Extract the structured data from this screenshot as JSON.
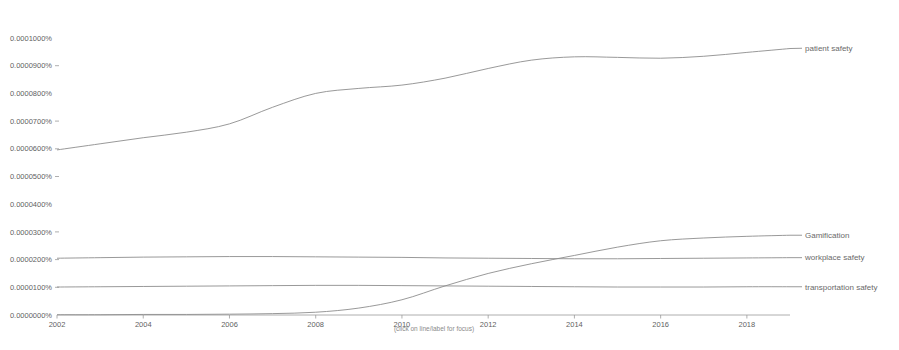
{
  "chart_data": {
    "type": "line",
    "title": "",
    "subtitle": "",
    "xlabel": "",
    "ylabel": "",
    "grid": false,
    "legend_position": "right-inline",
    "hint": "(click on line/label for focus)",
    "xlim": [
      2002,
      2019
    ],
    "ylim": [
      0.0,
      0.0001
    ],
    "y_tick_labels": [
      "0.0001000%",
      "0.0000900%",
      "0.0000800%",
      "0.0000700%",
      "0.0000600%",
      "0.0000500%",
      "0.0000400%",
      "0.0000300%",
      "0.0000200%",
      "0.0000100%",
      "0.0000000%"
    ],
    "y_tick_values": [
      0.0001,
      9e-05,
      8e-05,
      7e-05,
      6e-05,
      5e-05,
      4e-05,
      3e-05,
      2e-05,
      1e-05,
      0.0
    ],
    "x_tick_labels": [
      "2002",
      "2004",
      "2006",
      "2008",
      "2010",
      "2012",
      "2014",
      "2016",
      "2018"
    ],
    "x_tick_values": [
      2002,
      2004,
      2006,
      2008,
      2010,
      2012,
      2014,
      2016,
      2018
    ],
    "x": [
      2002,
      2003,
      2004,
      2005,
      2006,
      2007,
      2008,
      2009,
      2010,
      2011,
      2012,
      2013,
      2014,
      2015,
      2016,
      2017,
      2018,
      2019
    ],
    "series": [
      {
        "name": "patient safety",
        "color": "#8d8d8d",
        "label_y_value": 9.63e-05,
        "values": [
          5.96e-05,
          6.18e-05,
          6.4e-05,
          6.6e-05,
          6.9e-05,
          7.5e-05,
          8e-05,
          8.18e-05,
          8.3e-05,
          8.55e-05,
          8.9e-05,
          9.2e-05,
          9.32e-05,
          9.3e-05,
          9.27e-05,
          9.34e-05,
          9.48e-05,
          9.62e-05
        ]
      },
      {
        "name": "Gamification",
        "color": "#8d8d8d",
        "label_y_value": 2.88e-05,
        "values": [
          1e-07,
          1e-07,
          2e-07,
          2e-07,
          3e-07,
          5e-07,
          1e-06,
          2.5e-06,
          5.5e-06,
          1.05e-05,
          1.5e-05,
          1.85e-05,
          2.15e-05,
          2.45e-05,
          2.68e-05,
          2.78e-05,
          2.84e-05,
          2.88e-05
        ]
      },
      {
        "name": "workplace safety",
        "color": "#8d8d8d",
        "label_y_value": 2.07e-05,
        "values": [
          2.05e-05,
          2.07e-05,
          2.09e-05,
          2.1e-05,
          2.11e-05,
          2.11e-05,
          2.1e-05,
          2.09e-05,
          2.08e-05,
          2.06e-05,
          2.05e-05,
          2.04e-05,
          2.03e-05,
          2.03e-05,
          2.04e-05,
          2.05e-05,
          2.06e-05,
          2.07e-05
        ]
      },
      {
        "name": "transportation safety",
        "color": "#8d8d8d",
        "label_y_value": 1.02e-05,
        "values": [
          1.01e-05,
          1.02e-05,
          1.03e-05,
          1.04e-05,
          1.05e-05,
          1.06e-05,
          1.07e-05,
          1.07e-05,
          1.06e-05,
          1.05e-05,
          1.04e-05,
          1.03e-05,
          1.02e-05,
          1.01e-05,
          1.01e-05,
          1.01e-05,
          1.02e-05,
          1.02e-05
        ]
      }
    ]
  }
}
